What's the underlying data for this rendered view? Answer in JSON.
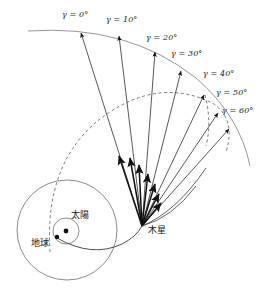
{
  "figure": {
    "type": "orbital-trajectory-diagram",
    "background_color": "#ffffff",
    "stroke_color": "#3a3a3a",
    "dashed_color": "#4a4a4a",
    "arrow_color": "#111111",
    "width": 277,
    "height": 296
  },
  "angle_labels": [
    {
      "id": "g0",
      "text": "γ = 0°",
      "x": 62,
      "y": 14,
      "value": 0
    },
    {
      "id": "g10",
      "text": "γ = 10°",
      "x": 106,
      "y": 18,
      "value": 10
    },
    {
      "id": "g20",
      "text": "γ = 20°",
      "x": 146,
      "y": 36,
      "value": 20
    },
    {
      "id": "g30",
      "text": "γ = 30°",
      "x": 172,
      "y": 52,
      "value": 30
    },
    {
      "id": "g40",
      "text": "γ = 40°",
      "x": 203,
      "y": 72,
      "value": 40
    },
    {
      "id": "g50",
      "text": "γ = 50°",
      "x": 218,
      "y": 90,
      "value": 50
    },
    {
      "id": "g60",
      "text": "γ = 60°",
      "x": 224,
      "y": 107,
      "value": 60
    }
  ],
  "body_labels": [
    {
      "id": "sun",
      "text": "太陽",
      "meaning": "Sun",
      "x": 71,
      "y": 213
    },
    {
      "id": "earth",
      "text": "地球",
      "meaning": "Earth",
      "x": 31,
      "y": 239
    },
    {
      "id": "jupiter",
      "text": "木星",
      "meaning": "Jupiter",
      "x": 148,
      "y": 228
    }
  ],
  "markers": {
    "sun_dot": {
      "x": 66,
      "y": 231,
      "r": 2.4
    },
    "earth_dot": {
      "x": 57,
      "y": 237,
      "r": 2.2
    },
    "jupiter_node": {
      "x": 142,
      "y": 226
    }
  },
  "orbits": {
    "earth_orbit_circle": {
      "cx": 67,
      "cy": 230,
      "r": 50
    },
    "sun_inner_circle": {
      "cx": 66,
      "cy": 231,
      "r": 13
    }
  },
  "rays": [
    {
      "angle": 0,
      "tip_x": 81,
      "tip_y": 30
    },
    {
      "angle": 10,
      "tip_x": 119,
      "tip_y": 33
    },
    {
      "angle": 20,
      "tip_x": 155,
      "tip_y": 49
    },
    {
      "angle": 30,
      "tip_x": 182,
      "tip_y": 68
    },
    {
      "angle": 40,
      "tip_x": 205,
      "tip_y": 92
    },
    {
      "angle": 50,
      "tip_x": 219,
      "tip_y": 110
    },
    {
      "angle": 60,
      "tip_x": 230,
      "tip_y": 126
    }
  ],
  "short_arrows": [
    {
      "angle": 0,
      "tip_x": 119,
      "tip_y": 152
    },
    {
      "angle": 10,
      "tip_x": 130,
      "tip_y": 154
    },
    {
      "angle": 20,
      "tip_x": 139,
      "tip_y": 161
    },
    {
      "angle": 30,
      "tip_x": 148,
      "tip_y": 170
    },
    {
      "angle": 40,
      "tip_x": 155,
      "tip_y": 180
    },
    {
      "angle": 50,
      "tip_x": 159,
      "tip_y": 190
    },
    {
      "angle": 60,
      "tip_x": 161,
      "tip_y": 200
    }
  ],
  "outer_arc": {
    "start_x": 28,
    "start_y": 31,
    "end_x": 250,
    "end_y": 166,
    "description": "solid outer boundary arc spanning all ray tips"
  },
  "dashed_arc": {
    "description": "dashed inner trajectory arc from earth region sweeping right and down"
  }
}
